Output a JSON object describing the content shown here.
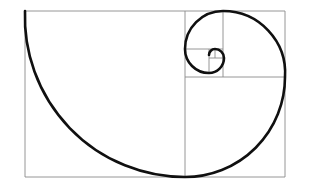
{
  "figure": {
    "type": "geometric-diagram",
    "canvas": {
      "width": 311,
      "height": 190,
      "background": "#ffffff"
    },
    "style": {
      "grid_color": "#8a8a8a",
      "grid_width": 0.9,
      "spiral_color": "#101010",
      "spiral_width": 2.6
    },
    "bounding_rect": {
      "x": 25,
      "y": 11,
      "width": 260,
      "height": 166
    },
    "squares": [
      {
        "index": 1,
        "fib": 13,
        "size": 160,
        "x": 25,
        "y": 11,
        "corner": "bottom-right",
        "arc_from": [
          25,
          11
        ],
        "arc_to": [
          185,
          177
        ]
      },
      {
        "index": 2,
        "fib": 8,
        "size": 100,
        "x": 185,
        "y": 77,
        "corner": "bottom-left",
        "arc_from": [
          185,
          177
        ],
        "arc_to": [
          285,
          77
        ]
      },
      {
        "index": 3,
        "fib": 5,
        "size": 62,
        "x": 185,
        "y": 11,
        "corner": "top-left",
        "arc_from": [
          285,
          77
        ],
        "arc_to": [
          223,
          11
        ]
      },
      {
        "index": 4,
        "fib": 3,
        "size": 38,
        "x": 185,
        "y": 11,
        "corner": "top-right",
        "arc_from": [
          223,
          11
        ],
        "arc_to": [
          185,
          49
        ]
      },
      {
        "index": 5,
        "fib": 2,
        "size": 24,
        "x": 185,
        "y": 49,
        "corner": "bottom-right",
        "arc_from": [
          185,
          49
        ],
        "arc_to": [
          209,
          73
        ]
      },
      {
        "index": 6,
        "fib": 1,
        "size": 15,
        "x": 209,
        "y": 58,
        "corner": "bottom-left",
        "arc_from": [
          209,
          73
        ],
        "arc_to": [
          224,
          58
        ]
      },
      {
        "index": 7,
        "fib": 1,
        "size": 9,
        "x": 215,
        "y": 49,
        "corner": "top-left",
        "arc_from": [
          224,
          58
        ],
        "arc_to": [
          215,
          49
        ]
      },
      {
        "index": 8,
        "fib": 1,
        "size": 6,
        "x": 215,
        "y": 49,
        "corner": "top-right",
        "arc_from": [
          215,
          49
        ],
        "arc_to": [
          209,
          55
        ]
      }
    ],
    "grid_segments": [
      {
        "name": "outer-rect-top",
        "x1": 25,
        "y1": 11,
        "x2": 285,
        "y2": 11
      },
      {
        "name": "outer-rect-right",
        "x1": 285,
        "y1": 11,
        "x2": 285,
        "y2": 177
      },
      {
        "name": "outer-rect-bottom",
        "x1": 285,
        "y1": 177,
        "x2": 25,
        "y2": 177
      },
      {
        "name": "outer-rect-left",
        "x1": 25,
        "y1": 177,
        "x2": 25,
        "y2": 11
      },
      {
        "name": "divider-main-square",
        "x1": 185,
        "y1": 11,
        "x2": 185,
        "y2": 177
      },
      {
        "name": "divider-sq8",
        "x1": 185,
        "y1": 77,
        "x2": 285,
        "y2": 77
      },
      {
        "name": "divider-sq5",
        "x1": 223,
        "y1": 11,
        "x2": 223,
        "y2": 77
      },
      {
        "name": "divider-sq3",
        "x1": 185,
        "y1": 49,
        "x2": 223,
        "y2": 49
      },
      {
        "name": "divider-sq2",
        "x1": 209,
        "y1": 49,
        "x2": 209,
        "y2": 73
      },
      {
        "name": "divider-sq1a",
        "x1": 209,
        "y1": 58,
        "x2": 224,
        "y2": 58
      },
      {
        "name": "divider-sq1b",
        "x1": 215,
        "y1": 49,
        "x2": 215,
        "y2": 58
      }
    ],
    "spiral_path": "M 25 11 A 160 160 0 0 0 185 177 A 100 100 0 0 0 285 77 A 62 62 0 0 0 223 11 A 38 38 0 0 0 185 49 A 24 24 0 0 0 209 73 A 15 15 0 0 0 224 58 A 9 9 0 0 0 215 49 A 6 6 0 0 0 209 55"
  }
}
